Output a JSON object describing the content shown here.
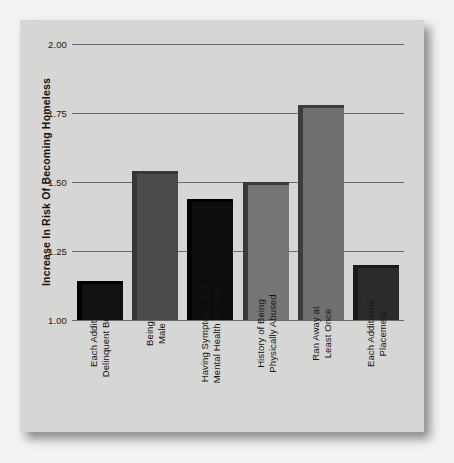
{
  "chart_data": {
    "type": "bar",
    "title": "",
    "xlabel": "",
    "ylabel": "Increase In Risk Of Becoming Homeless",
    "ylim": [
      1.0,
      2.0
    ],
    "yticks": [
      "1.00",
      "1.25",
      "1.50",
      "1.75",
      "2.00"
    ],
    "ytick_values": [
      1.0,
      1.25,
      1.5,
      1.75,
      2.0
    ],
    "grid": "horizontal",
    "legend": "none",
    "categories": [
      "Each Additional Delinquent Behavior",
      "Being Male",
      "Having Symptoms of a Mental Health Disorder",
      "History of Being Physically Abused",
      "Ran Away at Least Once",
      "Each Additional Placement"
    ],
    "category_lines": [
      [
        "Each Additional",
        "Delinquent Behavior"
      ],
      [
        "Being",
        "Male"
      ],
      [
        "Having Symptoms of a",
        "Mental Health Disorder"
      ],
      [
        "History of Being",
        "Physically Abused"
      ],
      [
        "Ran Away at",
        "Least Once"
      ],
      [
        "Each Additional",
        "Placement"
      ]
    ],
    "values": [
      1.14,
      1.54,
      1.44,
      1.5,
      1.78,
      1.2
    ],
    "bar_colors": [
      "#111111",
      "#4b4b4b",
      "#0d0d0d",
      "#757575",
      "#6f6f6f",
      "#2b2b2b"
    ],
    "bar_edge_colors": [
      "#000000",
      "#363636",
      "#000000",
      "#3a3a3a",
      "#3c3c3c",
      "#1a1a1a"
    ]
  },
  "style": {
    "page_background": "#f2f2f0",
    "card_background": "#d6d6d4",
    "gridline_color": "#6b6b6b",
    "text_color": "#141517"
  }
}
